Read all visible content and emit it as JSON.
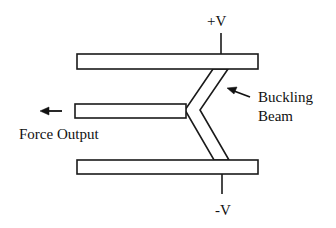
{
  "diagram": {
    "title": "",
    "labels": {
      "positive_voltage": "+V",
      "negative_voltage": "-V",
      "force_output": "Force Output",
      "buckling_beam_line1": "Buckling",
      "buckling_beam_line2": "Beam"
    },
    "elements": [
      {
        "id": "top-electrode",
        "type": "rect",
        "x": 77,
        "y": 54,
        "w": 181,
        "h": 15
      },
      {
        "id": "output-shuttle",
        "type": "rect",
        "x": 75,
        "y": 104,
        "w": 111,
        "h": 14
      },
      {
        "id": "bottom-electrode",
        "type": "rect",
        "x": 77,
        "y": 160,
        "w": 181,
        "h": 14
      },
      {
        "id": "buckling-beam",
        "type": "chevron",
        "apex_left": true
      },
      {
        "id": "positive-lead",
        "type": "line",
        "x": 221,
        "y1": 33,
        "y2": 54
      },
      {
        "id": "negative-lead",
        "type": "line",
        "x": 222,
        "y1": 174,
        "y2": 194
      }
    ],
    "colors": {
      "stroke": "#1a1a1a",
      "fill": "#ffffff",
      "text": "#111111"
    }
  }
}
